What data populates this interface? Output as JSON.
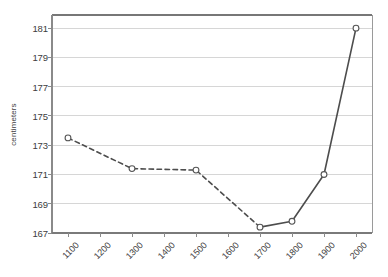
{
  "chart_data": {
    "type": "line",
    "title": "",
    "subtitle": "",
    "xlabel": "",
    "ylabel": "centimeters",
    "x": [
      1100,
      1300,
      1500,
      1700,
      1800,
      1900,
      2000
    ],
    "values": [
      173.5,
      171.4,
      171.3,
      167.4,
      167.8,
      171.0,
      181.0
    ],
    "series": [
      {
        "name": "height",
        "x": [
          1100,
          1300,
          1500,
          1700,
          1800,
          1900,
          2000
        ],
        "values": [
          173.5,
          171.4,
          171.3,
          167.4,
          167.8,
          171.0,
          181.0
        ],
        "segments": [
          {
            "style": "dashed",
            "x": [
              1100,
              1300,
              1500,
              1700
            ],
            "values": [
              173.5,
              171.4,
              171.3,
              167.4
            ]
          },
          {
            "style": "solid",
            "x": [
              1700,
              1800,
              1900,
              2000
            ],
            "values": [
              167.4,
              167.8,
              171.0,
              181.0
            ]
          }
        ],
        "marker": "open-circle",
        "color": "#4d4d4d"
      }
    ],
    "xlim": [
      1050,
      2050
    ],
    "ylim": [
      167,
      181.9
    ],
    "xticks": [
      1100,
      1200,
      1300,
      1400,
      1500,
      1600,
      1700,
      1800,
      1900,
      2000
    ],
    "xtick_labels": [
      "1100",
      "1200",
      "1300",
      "1400",
      "1500",
      "1600",
      "1700",
      "1800",
      "1900",
      "2000"
    ],
    "yticks": [
      167,
      169,
      171,
      173,
      175,
      177,
      179,
      181
    ],
    "ytick_labels": [
      "167",
      "169",
      "171",
      "173",
      "175",
      "177",
      "179",
      "181"
    ],
    "grid": "horizontal",
    "legend": "none",
    "xtick_label_rotation": -45,
    "colors": {
      "line": "#4d4d4d",
      "marker_stroke": "#555555",
      "marker_fill": "#ffffff",
      "grid": "#d6d6d6",
      "axis": "#808080",
      "background": "#ffffff",
      "text": "#3d3d3d"
    }
  }
}
